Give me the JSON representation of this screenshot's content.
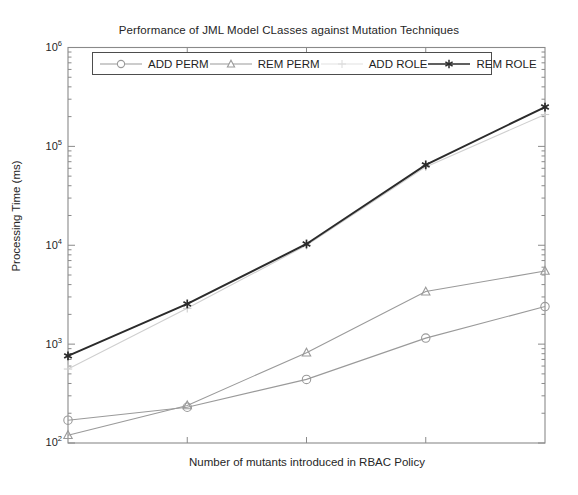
{
  "chart_data": {
    "type": "line",
    "title": "Performance of JML Model CLasses against Mutation Techniques",
    "xlabel": "Number of mutants introduced in RBAC Policy",
    "ylabel": "Processing Time (ms)",
    "yscale": "log",
    "ylim": [
      100,
      1000000
    ],
    "ytick_labels": [
      "10⁶",
      "10⁵",
      "10⁴",
      "10³",
      "10²"
    ],
    "ytick_values": [
      1000000,
      100000,
      10000,
      1000,
      100
    ],
    "ytick_bases": [
      "10",
      "10",
      "10",
      "10",
      "10"
    ],
    "ytick_exponents": [
      "6",
      "5",
      "4",
      "3",
      "2"
    ],
    "xtick_labels": [
      "",
      "",
      "",
      "",
      ""
    ],
    "x": [
      1,
      2,
      3,
      4,
      5
    ],
    "grid": false,
    "legend_position": "top-inside",
    "series": [
      {
        "name": "ADD PERM",
        "marker": "circle",
        "color": "#9a9a9a",
        "values": [
          170,
          230,
          440,
          1150,
          2400
        ]
      },
      {
        "name": "REM PERM",
        "marker": "triangle",
        "color": "#9a9a9a",
        "values": [
          120,
          240,
          820,
          3400,
          5500
        ]
      },
      {
        "name": "ADD ROLE",
        "marker": "plus",
        "color": "#cfcfcf",
        "values": [
          560,
          2300,
          10000,
          62000,
          210000
        ]
      },
      {
        "name": "REM ROLE",
        "marker": "asterisk",
        "color": "#2b2b2b",
        "values": [
          760,
          2550,
          10300,
          65000,
          250000
        ]
      }
    ]
  },
  "legend": {
    "items": [
      {
        "label": "ADD PERM",
        "marker": "circle-marker-icon"
      },
      {
        "label": "REM PERM",
        "marker": "triangle-marker-icon"
      },
      {
        "label": "ADD ROLE",
        "marker": "plus-marker-icon"
      },
      {
        "label": "REM ROLE",
        "marker": "asterisk-marker-icon"
      }
    ]
  },
  "axes": {
    "frame_color": "#808080",
    "tick_color": "#808080"
  }
}
